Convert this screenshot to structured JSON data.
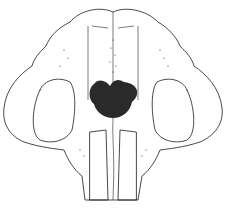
{
  "image": {
    "subject": "skull illustration, ventral/frontal view",
    "style": "stippled pen line drawing",
    "colors": {
      "ink": "#1a1a1a",
      "background": "#ffffff"
    }
  }
}
